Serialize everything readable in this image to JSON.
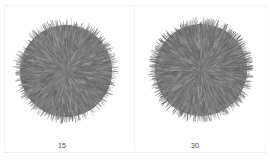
{
  "panels": [
    {
      "label": "15",
      "center": [
        66,
        71
      ],
      "radius": 54,
      "fur_color": "#777777",
      "strand_density": 15
    },
    {
      "label": "30",
      "center": [
        201,
        70
      ],
      "radius": 54,
      "fur_color": "#7a7a7a",
      "strand_density": 30
    }
  ],
  "colors": {
    "background": "#ffffff",
    "fur_dark": "#5e5e5e",
    "fur_mid": "#7a7a7a",
    "fur_light": "#a8a8a8",
    "caption": "#4a4a4a"
  }
}
